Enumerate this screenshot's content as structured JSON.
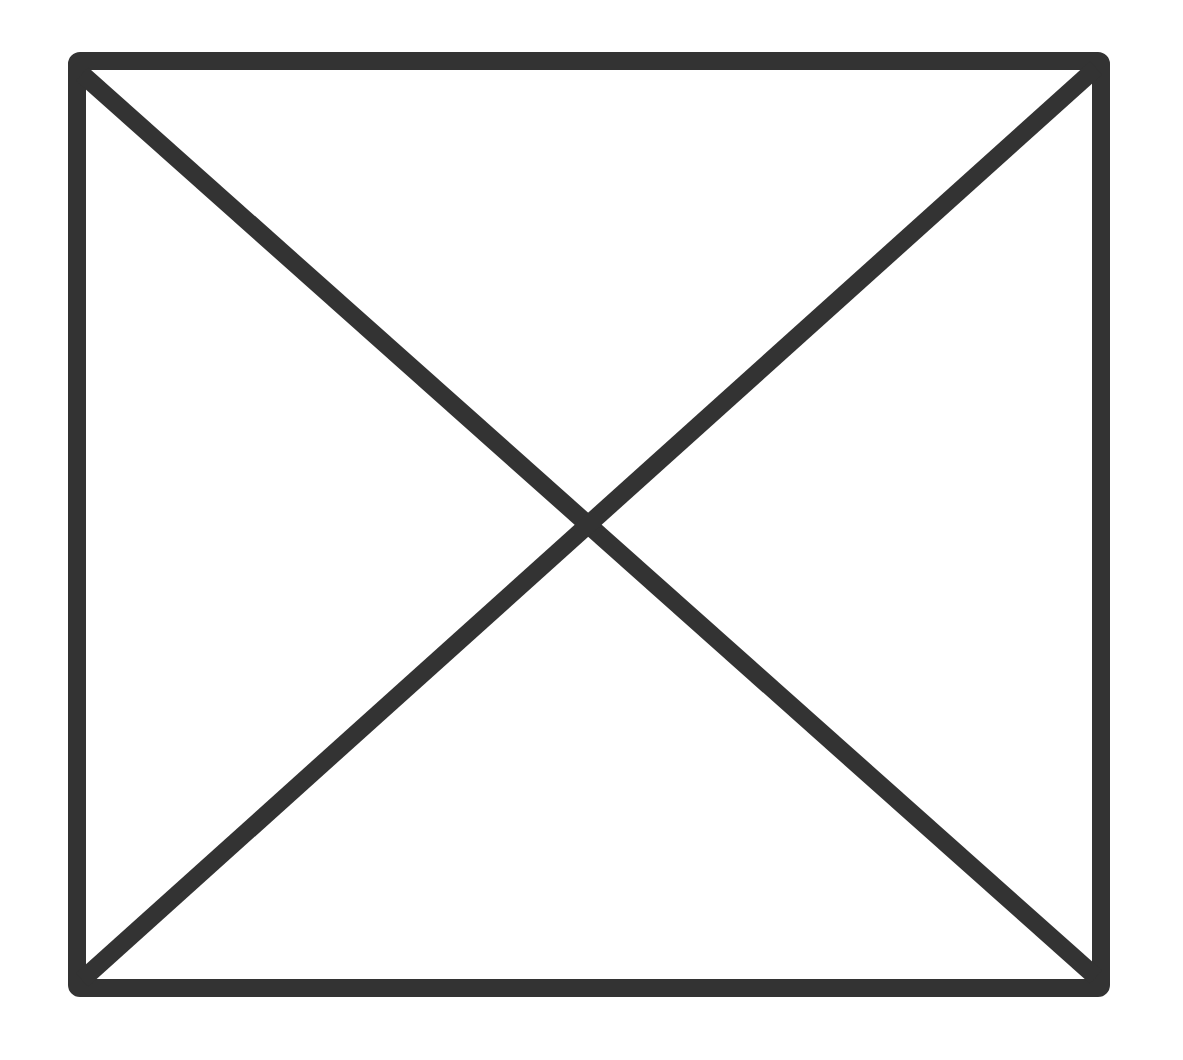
{
  "diagram": {
    "stroke_color": "#333333",
    "background_color": "#ffffff",
    "stroke_width": 18,
    "rectangle": {
      "x1": 77,
      "y1": 61,
      "x2": 1101,
      "y2": 988
    },
    "diagonals": [
      {
        "from": "top-left",
        "to": "bottom-right",
        "x1": 82,
        "y1": 74,
        "x2": 1096,
        "y2": 977
      },
      {
        "from": "top-right",
        "to": "bottom-left",
        "x1": 1096,
        "y1": 68,
        "x2": 82,
        "y2": 980
      }
    ],
    "intersection": {
      "x": 588,
      "y": 514
    }
  }
}
